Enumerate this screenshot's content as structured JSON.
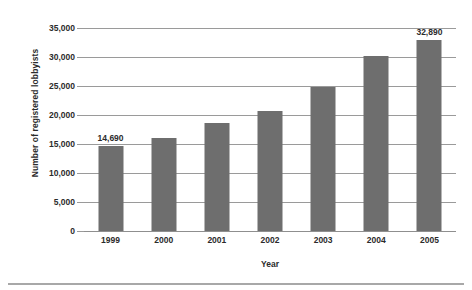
{
  "chart_data": {
    "type": "bar",
    "title": "",
    "xlabel": "Year",
    "ylabel": "Number of registered lobbyists",
    "categories": [
      "1999",
      "2000",
      "2001",
      "2002",
      "2003",
      "2004",
      "2005"
    ],
    "values": [
      14690,
      16100,
      18600,
      20700,
      24900,
      30200,
      32890
    ],
    "point_labels": [
      "14,690",
      "",
      "",
      "",
      "",
      "",
      "32,890"
    ],
    "ylim": [
      0,
      35000
    ],
    "ytick_values": [
      0,
      5000,
      10000,
      15000,
      20000,
      25000,
      30000,
      35000
    ],
    "ytick_labels": [
      "0",
      "5,000",
      "10,000",
      "15,000",
      "20,000",
      "25,000",
      "30,000",
      "35,000"
    ],
    "grid": true,
    "legend": "none",
    "bar_color": "#6e6e6e",
    "gridline_color": "#9a9a9a",
    "text_color": "#2b2b2b",
    "background_color": "#ffffff"
  }
}
